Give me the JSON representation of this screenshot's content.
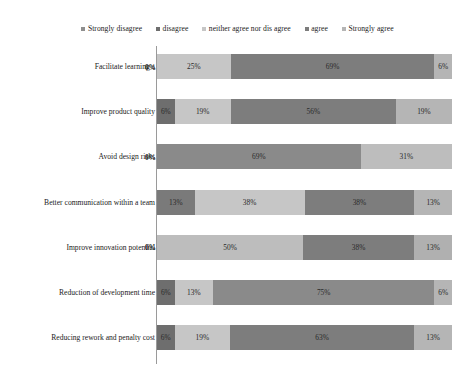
{
  "chart_data": {
    "type": "bar",
    "orientation": "horizontal",
    "stacked": true,
    "normalized_percent": true,
    "title": "",
    "subtitle": "",
    "xlabel": "",
    "ylabel": "",
    "xlim": [
      0,
      100
    ],
    "grid": false,
    "legend_position": "top",
    "legend": [
      "Strongly disagree",
      "disagree",
      "neither agree nor dis agree",
      "agree",
      "Strongly agree"
    ],
    "series_colors": [
      "#8f8f8f",
      "#6e6e6e",
      "#c6c6c6",
      "#7d7d7d",
      "#b5b5b5"
    ],
    "categories": [
      "Facilitate learning a",
      "Improve product quality",
      "Avoid design risks",
      "Better communication within a team",
      "Improve innovation potential",
      "Reduction of development time",
      "Reducing rework and penalty cost"
    ],
    "series": [
      {
        "name": "Strongly disagree",
        "values": [
          0,
          6,
          0,
          13,
          0,
          6,
          6
        ]
      },
      {
        "name": "disagree",
        "values": [
          0,
          0,
          0,
          0,
          0,
          13,
          0
        ]
      },
      {
        "name": "neither agree nor dis agree",
        "values": [
          25,
          19,
          69,
          38,
          50,
          0,
          19
        ]
      },
      {
        "name": "agree",
        "values": [
          69,
          56,
          0,
          38,
          38,
          75,
          63
        ]
      },
      {
        "name": "Strongly agree",
        "values": [
          6,
          19,
          31,
          13,
          13,
          6,
          13
        ]
      }
    ],
    "rows": [
      {
        "category": "Facilitate learning a",
        "segments": [
          {
            "series": "Strongly disagree",
            "value": 0,
            "label": "0%",
            "color": "#8f8f8f"
          },
          {
            "series": "neither agree nor dis agree",
            "value": 25,
            "label": "25%",
            "color": "#c6c6c6"
          },
          {
            "series": "agree",
            "value": 69,
            "label": "69%",
            "color": "#7d7d7d"
          },
          {
            "series": "Strongly agree",
            "value": 6,
            "label": "6%",
            "color": "#b5b5b5"
          }
        ]
      },
      {
        "category": "Improve product quality",
        "segments": [
          {
            "series": "Strongly disagree",
            "value": 6,
            "label": "6%",
            "color": "#6e6e6e"
          },
          {
            "series": "neither agree nor dis agree",
            "value": 19,
            "label": "19%",
            "color": "#c6c6c6"
          },
          {
            "series": "agree",
            "value": 56,
            "label": "56%",
            "color": "#7d7d7d"
          },
          {
            "series": "Strongly agree",
            "value": 19,
            "label": "19%",
            "color": "#b5b5b5"
          }
        ]
      },
      {
        "category": "Avoid design risks",
        "segments": [
          {
            "series": "Strongly disagree",
            "value": 0,
            "label": "0%",
            "color": "#8f8f8f"
          },
          {
            "series": "neither agree nor dis agree",
            "value": 69,
            "label": "69%",
            "color": "#8a8a8a"
          },
          {
            "series": "Strongly agree",
            "value": 31,
            "label": "31%",
            "color": "#bdbdbd"
          }
        ]
      },
      {
        "category": "Better communication within a team",
        "segments": [
          {
            "series": "Strongly disagree",
            "value": 13,
            "label": "13%",
            "color": "#7a7a7a"
          },
          {
            "series": "neither agree nor dis agree",
            "value": 38,
            "label": "38%",
            "color": "#c6c6c6"
          },
          {
            "series": "agree",
            "value": 38,
            "label": "38%",
            "color": "#7d7d7d"
          },
          {
            "series": "Strongly agree",
            "value": 13,
            "label": "13%",
            "color": "#b5b5b5"
          }
        ]
      },
      {
        "category": "Improve innovation potential",
        "segments": [
          {
            "series": "Strongly disagree",
            "value": 0,
            "label": "0%",
            "color": "#8f8f8f"
          },
          {
            "series": "neither agree nor dis agree",
            "value": 50,
            "label": "50%",
            "color": "#bdbdbd"
          },
          {
            "series": "agree",
            "value": 38,
            "label": "38%",
            "color": "#7d7d7d"
          },
          {
            "series": "Strongly agree",
            "value": 13,
            "label": "13%",
            "color": "#b0b0b0"
          }
        ]
      },
      {
        "category": "Reduction of development time",
        "segments": [
          {
            "series": "Strongly disagree",
            "value": 6,
            "label": "6%",
            "color": "#6e6e6e"
          },
          {
            "series": "disagree",
            "value": 13,
            "label": "13%",
            "color": "#c6c6c6"
          },
          {
            "series": "agree",
            "value": 75,
            "label": "75%",
            "color": "#8a8a8a"
          },
          {
            "series": "Strongly agree",
            "value": 6,
            "label": "6%",
            "color": "#b5b5b5"
          }
        ]
      },
      {
        "category": "Reducing rework and penalty cost",
        "segments": [
          {
            "series": "Strongly disagree",
            "value": 6,
            "label": "6%",
            "color": "#6e6e6e"
          },
          {
            "series": "neither agree nor dis agree",
            "value": 19,
            "label": "19%",
            "color": "#c6c6c6"
          },
          {
            "series": "agree",
            "value": 63,
            "label": "63%",
            "color": "#7d7d7d"
          },
          {
            "series": "Strongly agree",
            "value": 13,
            "label": "13%",
            "color": "#b5b5b5"
          }
        ]
      }
    ]
  }
}
